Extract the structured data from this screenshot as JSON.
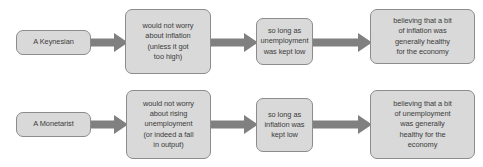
{
  "diagram": {
    "type": "flowchart",
    "colors": {
      "box_fill": "#d9d9d9",
      "box_border": "#8c8c8c",
      "arrow_fill": "#808080",
      "text": "#3b3b3b",
      "background": "#ffffff"
    },
    "rows": [
      {
        "id": "keynesian-row",
        "label": "A Keynesian",
        "nodes": [
          {
            "id": "keynesian-actor",
            "text": "A Keynesian"
          },
          {
            "id": "keynesian-step-1",
            "text": "would not worry\nabout inflation\n(unless it got\ntoo high)"
          },
          {
            "id": "keynesian-step-2",
            "text": "so long as\nunemployment\nwas kept low"
          },
          {
            "id": "keynesian-step-3",
            "text": "believing that a bit\nof inflation was\ngenerally healthy\nfor the economy"
          }
        ],
        "arrows": [
          {
            "id": "keynesian-arrow-1"
          },
          {
            "id": "keynesian-arrow-2"
          },
          {
            "id": "keynesian-arrow-3"
          }
        ]
      },
      {
        "id": "monetarist-row",
        "label": "A Monetarist",
        "nodes": [
          {
            "id": "monetarist-actor",
            "text": "A Monetarist"
          },
          {
            "id": "monetarist-step-1",
            "text": "would not worry\nabout rising\nunemployment\n(or indeed a fall\nin output)"
          },
          {
            "id": "monetarist-step-2",
            "text": "so long as\ninflation was\nkept low"
          },
          {
            "id": "monetarist-step-3",
            "text": "believing that a bit\nof unemployment\nwas generally\nhealthy for the\neconomy"
          }
        ],
        "arrows": [
          {
            "id": "monetarist-arrow-1"
          },
          {
            "id": "monetarist-arrow-2"
          },
          {
            "id": "monetarist-arrow-3"
          }
        ]
      }
    ]
  }
}
